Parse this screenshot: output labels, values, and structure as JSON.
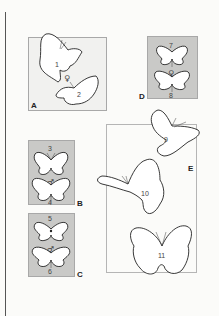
{
  "figure": {
    "panels": [
      {
        "id": "A",
        "label": "A",
        "background": "#f1f1ef"
      },
      {
        "id": "B",
        "label": "B",
        "background": "#c9c9c7"
      },
      {
        "id": "C",
        "label": "C",
        "background": "#c9c9c7"
      },
      {
        "id": "D",
        "label": "D",
        "background": "#c9c9c7"
      },
      {
        "id": "E",
        "label": "E",
        "background": "transparent"
      }
    ],
    "specimens": [
      {
        "number": "1",
        "panel": "A"
      },
      {
        "number": "2",
        "panel": "A"
      },
      {
        "number": "3",
        "panel": "B"
      },
      {
        "number": "4",
        "panel": "B"
      },
      {
        "number": "5",
        "panel": "C"
      },
      {
        "number": "6",
        "panel": "C"
      },
      {
        "number": "7",
        "panel": "D"
      },
      {
        "number": "8",
        "panel": "D"
      },
      {
        "number": "9",
        "panel": "E"
      },
      {
        "number": "10",
        "panel": "E"
      },
      {
        "number": "11",
        "panel": "E"
      }
    ],
    "sex_symbols": {
      "A": "♀",
      "B": "♂",
      "C": "♂",
      "D": "♀"
    }
  }
}
